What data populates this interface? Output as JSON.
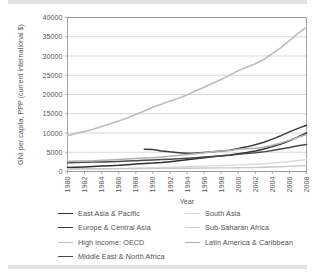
{
  "figure": {
    "top_rule_color": "#e2e2e2",
    "bottom_rule_color": "#e2e2e2"
  },
  "chart_data": {
    "type": "line",
    "title": "",
    "xlabel": "Year",
    "ylabel": "GNI per capita, PPP (current international $)",
    "xlim": [
      1980,
      2008
    ],
    "ylim": [
      0,
      40000
    ],
    "grid": true,
    "legend_position": "bottom",
    "x_ticks": [
      "1980",
      "1982",
      "1984",
      "1986",
      "1988",
      "1990",
      "1992",
      "1994",
      "1996",
      "1998",
      "2000",
      "2002",
      "2004",
      "2006",
      "2008"
    ],
    "y_ticks": [
      "0",
      "5000",
      "10000",
      "15000",
      "20000",
      "25000",
      "30000",
      "35000",
      "40000"
    ],
    "x": [
      1980,
      1981,
      1982,
      1983,
      1984,
      1985,
      1986,
      1987,
      1988,
      1989,
      1990,
      1991,
      1992,
      1993,
      1994,
      1995,
      1996,
      1997,
      1998,
      1999,
      2000,
      2001,
      2002,
      2003,
      2004,
      2005,
      2006,
      2007,
      2008
    ],
    "series": [
      {
        "name": "East Asia & Pacific",
        "color": "#2f2f2f",
        "width": 1.5,
        "x_start": 1980,
        "values": [
          1050,
          1120,
          1200,
          1300,
          1420,
          1520,
          1620,
          1780,
          1960,
          2080,
          2180,
          2340,
          2560,
          2820,
          3080,
          3340,
          3600,
          3860,
          4060,
          4280,
          4620,
          4940,
          5340,
          5860,
          6460,
          7140,
          8000,
          9000,
          10000
        ]
      },
      {
        "name": "Europe & Central Asia",
        "color": "#3d3d3d",
        "width": 1.5,
        "x_start": 1989,
        "values": [
          null,
          null,
          null,
          null,
          null,
          null,
          null,
          null,
          null,
          5800,
          5700,
          5350,
          5100,
          4900,
          4750,
          4800,
          4950,
          5150,
          5300,
          5500,
          5950,
          6400,
          6950,
          7600,
          8400,
          9300,
          10300,
          11200,
          12000
        ]
      },
      {
        "name": "High income: OECD",
        "color": "#bdbdbd",
        "width": 1.6,
        "x_start": 1980,
        "values": [
          9300,
          9900,
          10400,
          11000,
          11700,
          12400,
          13100,
          13900,
          14800,
          15700,
          16700,
          17500,
          18300,
          19000,
          19900,
          20900,
          21900,
          22900,
          23900,
          25000,
          26200,
          27100,
          28000,
          29100,
          30600,
          32200,
          34000,
          35900,
          37500
        ]
      },
      {
        "name": "Middle East & North Africa",
        "color": "#4a4a4a",
        "width": 1.5,
        "x_start": 1980,
        "values": [
          2300,
          2350,
          2400,
          2450,
          2500,
          2560,
          2620,
          2700,
          2800,
          2900,
          3000,
          3100,
          3200,
          3300,
          3450,
          3600,
          3760,
          3920,
          4050,
          4200,
          4450,
          4650,
          4850,
          5100,
          5450,
          5850,
          6250,
          6700,
          7000
        ]
      },
      {
        "name": "South Asia",
        "color": "#dadada",
        "width": 1.4,
        "x_start": 1980,
        "values": [
          560,
          590,
          620,
          660,
          700,
          740,
          780,
          820,
          880,
          940,
          1000,
          1040,
          1090,
          1150,
          1220,
          1300,
          1390,
          1460,
          1540,
          1640,
          1720,
          1800,
          1880,
          2000,
          2180,
          2380,
          2600,
          2850,
          3050
        ]
      },
      {
        "name": "Sub-Saharan Africa",
        "color": "#c9c9c9",
        "width": 1.4,
        "x_start": 1980,
        "values": [
          710,
          720,
          720,
          720,
          720,
          730,
          740,
          750,
          770,
          790,
          800,
          810,
          810,
          820,
          840,
          860,
          890,
          910,
          930,
          950,
          980,
          1010,
          1040,
          1090,
          1160,
          1240,
          1330,
          1430,
          1520
        ]
      },
      {
        "name": "Latin America & Caribbean",
        "color": "#b0b0b0",
        "width": 1.5,
        "x_start": 1980,
        "values": [
          2600,
          2700,
          2750,
          2780,
          2900,
          3000,
          3100,
          3220,
          3350,
          3500,
          3600,
          3760,
          3950,
          4150,
          4420,
          4600,
          4850,
          5150,
          5350,
          5450,
          5750,
          5900,
          6050,
          6300,
          6800,
          7400,
          8100,
          8900,
          9600
        ]
      }
    ],
    "legend_left_column": [
      {
        "label": "East Asia & Pacific",
        "color": "#2f2f2f",
        "width": 1.6
      },
      {
        "label": "Europe & Central Asia",
        "color": "#3d3d3d",
        "width": 1.6
      },
      {
        "label": "High income: OECD",
        "color": "#bdbdbd",
        "width": 1.4
      },
      {
        "label": "Middle East & North Africa",
        "color": "#4a4a4a",
        "width": 1.6
      }
    ],
    "legend_right_column": [
      {
        "label": "South Asia",
        "color": "#dadada",
        "width": 1.4
      },
      {
        "label": "Sub-Saharan Africa",
        "color": "#c9c9c9",
        "width": 1.4
      },
      {
        "label": "Latin America & Caribbean",
        "color": "#b0b0b0",
        "width": 1.5
      }
    ]
  }
}
